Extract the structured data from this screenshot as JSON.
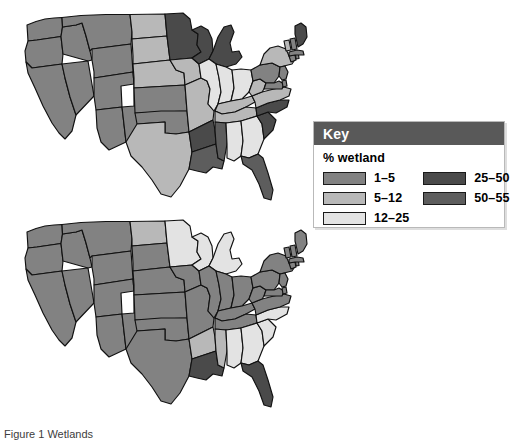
{
  "figure": {
    "caption": "Figure 1 Wetlands"
  },
  "key": {
    "title": "Key",
    "subtitle": "% wetland",
    "columns": [
      {
        "entries": [
          {
            "label": "1–5",
            "color": "#828282"
          },
          {
            "label": "5–12",
            "color": "#b8b8b8"
          },
          {
            "label": "12–25",
            "color": "#e3e3e3"
          }
        ]
      },
      {
        "entries": [
          {
            "label": "25–50",
            "color": "#4a4a4a"
          },
          {
            "label": "50–55",
            "color": "#5d5d5d"
          }
        ]
      }
    ]
  },
  "colors": {
    "c1_5": "#828282",
    "c5_12": "#b8b8b8",
    "c12_25": "#e3e3e3",
    "c25_50": "#4a4a4a",
    "c50_55": "#5d5d5d",
    "white": "#ffffff",
    "outline": "#111111",
    "key_header_bg": "#595959"
  },
  "chart_data": {
    "type": "map",
    "maps": [
      {
        "name": "top-map",
        "label": "Wetland extent map (upper)",
        "states": [
          {
            "code": "WA",
            "bin": "1–5",
            "color": "#828282"
          },
          {
            "code": "OR",
            "bin": "1–5",
            "color": "#828282"
          },
          {
            "code": "CA",
            "bin": "1–5",
            "color": "#828282"
          },
          {
            "code": "ID",
            "bin": "1–5",
            "color": "#828282"
          },
          {
            "code": "NV",
            "bin": "1–5",
            "color": "#828282"
          },
          {
            "code": "MT",
            "bin": "1–5",
            "color": "#828282"
          },
          {
            "code": "WY",
            "bin": "1–5",
            "color": "#828282"
          },
          {
            "code": "UT",
            "bin": "1–5",
            "color": "#828282"
          },
          {
            "code": "AZ",
            "bin": "1–5",
            "color": "#828282"
          },
          {
            "code": "CO",
            "bin": "1–5",
            "color": "#828282"
          },
          {
            "code": "NM",
            "bin": "1–5",
            "color": "#828282"
          },
          {
            "code": "ND",
            "bin": "5–12",
            "color": "#b8b8b8"
          },
          {
            "code": "SD",
            "bin": "5–12",
            "color": "#b8b8b8"
          },
          {
            "code": "NE",
            "bin": "5–12",
            "color": "#b8b8b8"
          },
          {
            "code": "KS",
            "bin": "1–5",
            "color": "#828282"
          },
          {
            "code": "OK",
            "bin": "1–5",
            "color": "#828282"
          },
          {
            "code": "TX",
            "bin": "5–12",
            "color": "#b8b8b8"
          },
          {
            "code": "MN",
            "bin": "25–50",
            "color": "#4a4a4a"
          },
          {
            "code": "IA",
            "bin": "5–12",
            "color": "#b8b8b8"
          },
          {
            "code": "MO",
            "bin": "5–12",
            "color": "#b8b8b8"
          },
          {
            "code": "AR",
            "bin": "25–50",
            "color": "#4a4a4a"
          },
          {
            "code": "LA",
            "bin": "50–55",
            "color": "#5d5d5d"
          },
          {
            "code": "WI",
            "bin": "25–50",
            "color": "#4a4a4a"
          },
          {
            "code": "MI",
            "bin": "25–50",
            "color": "#4a4a4a"
          },
          {
            "code": "IL",
            "bin": "12–25",
            "color": "#e3e3e3"
          },
          {
            "code": "IN",
            "bin": "12–25",
            "color": "#e3e3e3"
          },
          {
            "code": "OH",
            "bin": "12–25",
            "color": "#e3e3e3"
          },
          {
            "code": "KY",
            "bin": "5–12",
            "color": "#b8b8b8"
          },
          {
            "code": "TN",
            "bin": "5–12",
            "color": "#b8b8b8"
          },
          {
            "code": "MS",
            "bin": "50–55",
            "color": "#5d5d5d"
          },
          {
            "code": "AL",
            "bin": "12–25",
            "color": "#e3e3e3"
          },
          {
            "code": "GA",
            "bin": "12–25",
            "color": "#e3e3e3"
          },
          {
            "code": "FL",
            "bin": "50–55",
            "color": "#5d5d5d"
          },
          {
            "code": "SC",
            "bin": "25–50",
            "color": "#4a4a4a"
          },
          {
            "code": "NC",
            "bin": "25–50",
            "color": "#4a4a4a"
          },
          {
            "code": "VA",
            "bin": "5–12",
            "color": "#b8b8b8"
          },
          {
            "code": "WV",
            "bin": "5–12",
            "color": "#b8b8b8"
          },
          {
            "code": "PA",
            "bin": "1–5",
            "color": "#828282"
          },
          {
            "code": "NY",
            "bin": "5–12",
            "color": "#b8b8b8"
          },
          {
            "code": "MD",
            "bin": "1–5",
            "color": "#828282"
          },
          {
            "code": "DE",
            "bin": "1–5",
            "color": "#828282"
          },
          {
            "code": "NJ",
            "bin": "1–5",
            "color": "#828282"
          },
          {
            "code": "CT",
            "bin": "1–5",
            "color": "#828282"
          },
          {
            "code": "RI",
            "bin": "1–5",
            "color": "#828282"
          },
          {
            "code": "MA",
            "bin": "1–5",
            "color": "#828282"
          },
          {
            "code": "VT",
            "bin": "5–12",
            "color": "#b8b8b8"
          },
          {
            "code": "NH",
            "bin": "1–5",
            "color": "#828282"
          },
          {
            "code": "ME",
            "bin": "25–50",
            "color": "#4a4a4a"
          }
        ]
      },
      {
        "name": "bottom-map",
        "label": "Wetland extent map (lower)",
        "states": [
          {
            "code": "WA",
            "bin": "1–5",
            "color": "#828282"
          },
          {
            "code": "OR",
            "bin": "1–5",
            "color": "#828282"
          },
          {
            "code": "CA",
            "bin": "1–5",
            "color": "#828282"
          },
          {
            "code": "ID",
            "bin": "1–5",
            "color": "#828282"
          },
          {
            "code": "NV",
            "bin": "1–5",
            "color": "#828282"
          },
          {
            "code": "MT",
            "bin": "1–5",
            "color": "#828282"
          },
          {
            "code": "WY",
            "bin": "1–5",
            "color": "#828282"
          },
          {
            "code": "UT",
            "bin": "1–5",
            "color": "#828282"
          },
          {
            "code": "AZ",
            "bin": "1–5",
            "color": "#828282"
          },
          {
            "code": "CO",
            "bin": "1–5",
            "color": "#828282"
          },
          {
            "code": "NM",
            "bin": "1–5",
            "color": "#828282"
          },
          {
            "code": "ND",
            "bin": "5–12",
            "color": "#b8b8b8"
          },
          {
            "code": "SD",
            "bin": "1–5",
            "color": "#828282"
          },
          {
            "code": "NE",
            "bin": "1–5",
            "color": "#828282"
          },
          {
            "code": "KS",
            "bin": "1–5",
            "color": "#828282"
          },
          {
            "code": "OK",
            "bin": "1–5",
            "color": "#828282"
          },
          {
            "code": "TX",
            "bin": "1–5",
            "color": "#828282"
          },
          {
            "code": "MN",
            "bin": "12–25",
            "color": "#e3e3e3"
          },
          {
            "code": "IA",
            "bin": "1–5",
            "color": "#828282"
          },
          {
            "code": "MO",
            "bin": "1–5",
            "color": "#828282"
          },
          {
            "code": "AR",
            "bin": "5–12",
            "color": "#b8b8b8"
          },
          {
            "code": "LA",
            "bin": "25–50",
            "color": "#4a4a4a"
          },
          {
            "code": "WI",
            "bin": "12–25",
            "color": "#e3e3e3"
          },
          {
            "code": "MI",
            "bin": "12–25",
            "color": "#e3e3e3"
          },
          {
            "code": "IL",
            "bin": "1–5",
            "color": "#828282"
          },
          {
            "code": "IN",
            "bin": "1–5",
            "color": "#828282"
          },
          {
            "code": "OH",
            "bin": "1–5",
            "color": "#828282"
          },
          {
            "code": "KY",
            "bin": "1–5",
            "color": "#828282"
          },
          {
            "code": "TN",
            "bin": "1–5",
            "color": "#828282"
          },
          {
            "code": "MS",
            "bin": "5–12",
            "color": "#b8b8b8"
          },
          {
            "code": "AL",
            "bin": "12–25",
            "color": "#e3e3e3"
          },
          {
            "code": "GA",
            "bin": "12–25",
            "color": "#e3e3e3"
          },
          {
            "code": "FL",
            "bin": "25–50",
            "color": "#4a4a4a"
          },
          {
            "code": "SC",
            "bin": "12–25",
            "color": "#e3e3e3"
          },
          {
            "code": "NC",
            "bin": "12–25",
            "color": "#e3e3e3"
          },
          {
            "code": "VA",
            "bin": "1–5",
            "color": "#828282"
          },
          {
            "code": "WV",
            "bin": "1–5",
            "color": "#828282"
          },
          {
            "code": "PA",
            "bin": "1–5",
            "color": "#828282"
          },
          {
            "code": "NY",
            "bin": "1–5",
            "color": "#828282"
          },
          {
            "code": "MD",
            "bin": "1–5",
            "color": "#828282"
          },
          {
            "code": "DE",
            "bin": "1–5",
            "color": "#828282"
          },
          {
            "code": "NJ",
            "bin": "1–5",
            "color": "#828282"
          },
          {
            "code": "CT",
            "bin": "1–5",
            "color": "#828282"
          },
          {
            "code": "RI",
            "bin": "1–5",
            "color": "#828282"
          },
          {
            "code": "MA",
            "bin": "1–5",
            "color": "#828282"
          },
          {
            "code": "VT",
            "bin": "1–5",
            "color": "#828282"
          },
          {
            "code": "NH",
            "bin": "1–5",
            "color": "#828282"
          },
          {
            "code": "ME",
            "bin": "1–5",
            "color": "#828282"
          }
        ]
      }
    ]
  }
}
